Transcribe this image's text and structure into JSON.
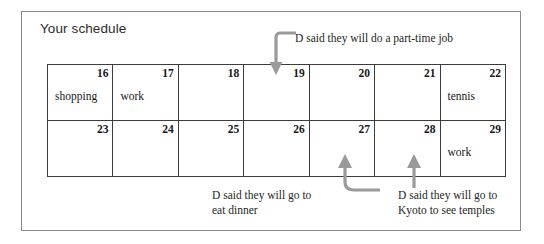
{
  "page": {
    "title": "Your schedule",
    "frame_border_color": "#8a8a8a",
    "table_border_color": "#3c3c3c",
    "arrow_color": "#9a9a9a",
    "text_color": "#16181a"
  },
  "schedule": {
    "rows": [
      [
        {
          "day": "16",
          "event": "shopping"
        },
        {
          "day": "17",
          "event": "work"
        },
        {
          "day": "18",
          "event": ""
        },
        {
          "day": "19",
          "event": ""
        },
        {
          "day": "20",
          "event": ""
        },
        {
          "day": "21",
          "event": ""
        },
        {
          "day": "22",
          "event": "tennis"
        }
      ],
      [
        {
          "day": "23",
          "event": ""
        },
        {
          "day": "24",
          "event": ""
        },
        {
          "day": "25",
          "event": ""
        },
        {
          "day": "26",
          "event": ""
        },
        {
          "day": "27",
          "event": ""
        },
        {
          "day": "28",
          "event": ""
        },
        {
          "day": "29",
          "event": "work"
        }
      ]
    ]
  },
  "annotations": {
    "part_time": {
      "text": "D said they will do a part-time job",
      "target_day": "19"
    },
    "dinner": {
      "line1": "D said they will go to",
      "line2": "eat dinner",
      "target_day": "27"
    },
    "kyoto": {
      "line1": "D said they will go to",
      "line2": "Kyoto to see temples",
      "target_day": "28"
    }
  }
}
